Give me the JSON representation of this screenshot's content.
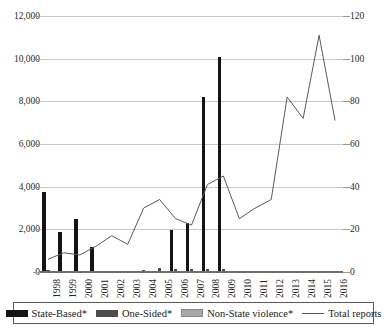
{
  "chart_data": {
    "type": "bar",
    "title": "",
    "xlabel": "",
    "ylabel": "",
    "y2label": "",
    "grid": true,
    "legend_position": "bottom",
    "categories": [
      "1998",
      "1999",
      "2000",
      "2001",
      "2002",
      "2003",
      "2004",
      "2005",
      "2006",
      "2007",
      "2008",
      "2009",
      "2010",
      "2011",
      "2012",
      "2013",
      "2014",
      "2015",
      "2016"
    ],
    "ylim": [
      0,
      12000
    ],
    "yticks": [
      "0",
      "2,000",
      "4,000",
      "6,000",
      "8,000",
      "10,000",
      "12,000"
    ],
    "ytick_values": [
      0,
      2000,
      4000,
      6000,
      8000,
      10000,
      12000
    ],
    "y2lim": [
      0,
      120
    ],
    "y2ticks": [
      "0",
      "20",
      "40",
      "60",
      "80",
      "100",
      "120"
    ],
    "y2tick_values": [
      0,
      20,
      40,
      60,
      80,
      100,
      120
    ],
    "series": [
      {
        "name": "State-Based*",
        "kind": "bar",
        "axis": "left",
        "color": "#141414",
        "values": [
          3750,
          1880,
          2480,
          1180,
          0,
          0,
          60,
          30,
          1960,
          2320,
          8200,
          10100,
          0,
          0,
          0,
          0,
          0,
          0,
          0
        ]
      },
      {
        "name": "One-Sided*",
        "kind": "bar",
        "axis": "left",
        "color": "#4d4d4d",
        "values": [
          90,
          60,
          70,
          30,
          40,
          30,
          110,
          180,
          120,
          130,
          150,
          160,
          0,
          0,
          0,
          0,
          0,
          0,
          0
        ]
      },
      {
        "name": "Non-State violence*",
        "kind": "bar",
        "axis": "left",
        "color": "#a8a8a8",
        "values": [
          30,
          20,
          20,
          10,
          20,
          20,
          40,
          50,
          40,
          40,
          50,
          60,
          0,
          0,
          0,
          0,
          0,
          0,
          0
        ]
      },
      {
        "name": "Total reports",
        "kind": "line",
        "axis": "right",
        "color": "#595959",
        "values": [
          6,
          9,
          8,
          12,
          17,
          13,
          30,
          34,
          25,
          22,
          41,
          45,
          25,
          30,
          34,
          82,
          72,
          111,
          71
        ]
      }
    ]
  },
  "legend": {
    "items": [
      {
        "label": "State-Based*",
        "swatch": "state"
      },
      {
        "label": "One-Sided*",
        "swatch": "onesided"
      },
      {
        "label": "Non-State violence*",
        "swatch": "nonstate"
      },
      {
        "label": "Total reports",
        "swatch": "line"
      }
    ]
  }
}
